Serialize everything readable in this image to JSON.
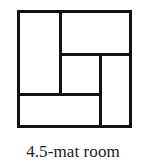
{
  "figure": {
    "caption": "4.5-mat room",
    "diagram_type": "tatami-mat-floor-plan",
    "colors": {
      "line": "#111111",
      "background": "#ffffff",
      "caption_text": "#1a1a1a"
    },
    "room": {
      "name": "4.5-mat room",
      "total_mats": "4.5",
      "arrangement": "pinwheel",
      "mats": [
        {
          "id": "west-mat",
          "label": "full mat",
          "size": "1",
          "orientation": "vertical"
        },
        {
          "id": "north-mat",
          "label": "full mat",
          "size": "1",
          "orientation": "horizontal"
        },
        {
          "id": "east-mat",
          "label": "full mat",
          "size": "1",
          "orientation": "vertical"
        },
        {
          "id": "south-mat",
          "label": "full mat",
          "size": "1",
          "orientation": "horizontal"
        },
        {
          "id": "center-mat",
          "label": "half mat",
          "size": "0.5",
          "orientation": "square"
        }
      ],
      "seams": [
        {
          "id": "seam-west-mat",
          "direction": "vertical"
        },
        {
          "id": "seam-north-mat",
          "direction": "horizontal"
        },
        {
          "id": "seam-east-mat",
          "direction": "vertical"
        },
        {
          "id": "seam-south-mat",
          "direction": "horizontal"
        }
      ]
    }
  }
}
